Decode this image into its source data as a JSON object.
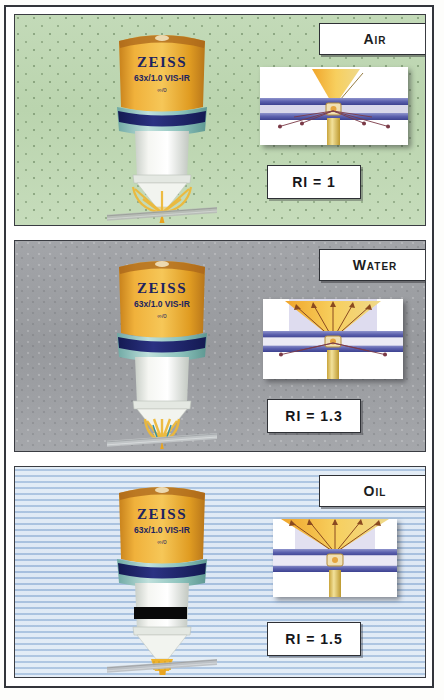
{
  "figure": {
    "panels": [
      {
        "id": "air",
        "media_label": "Air",
        "ri_label": "RI = 1",
        "ri_value": 1.0,
        "background_color": "#bcd6b1",
        "objective": {
          "brand": "ZEISS",
          "spec": "63x/1.0 VIS-IR",
          "tube": "∞/0",
          "collar_color": "#e8a428",
          "ring_color": "#2a2f7a",
          "has_black_band": false
        },
        "inset": {
          "cone_half_angle_deg": 22,
          "cone_color": "#f5c341",
          "rays_scattered": true,
          "coverslip_color": "#6b70b8",
          "note": "narrow collection cone, strong refraction at interfaces"
        }
      },
      {
        "id": "water",
        "media_label": "Water",
        "ri_label": "RI = 1.3",
        "ri_value": 1.3,
        "background_color": "#9d9fa3",
        "objective": {
          "brand": "ZEISS",
          "spec": "63x/1.0 VIS-IR",
          "tube": "∞/0",
          "collar_color": "#e8a428",
          "ring_color": "#2a2f7a",
          "has_black_band": false
        },
        "inset": {
          "cone_half_angle_deg": 42,
          "cone_color": "#f5c341",
          "rays_scattered": true,
          "coverslip_color": "#6b70b8",
          "note": "wider collection cone, reduced refraction"
        }
      },
      {
        "id": "oil",
        "media_label": "Oil",
        "ri_label": "RI = 1.5",
        "ri_value": 1.5,
        "background_color": "#b9cfe8",
        "objective": {
          "brand": "ZEISS",
          "spec": "63x/1.0 VIS-IR",
          "tube": "∞/0",
          "collar_color": "#e8a428",
          "ring_color": "#2a2f7a",
          "has_black_band": true
        },
        "inset": {
          "cone_half_angle_deg": 62,
          "cone_color": "#f5c341",
          "rays_scattered": false,
          "coverslip_color": "#6b70b8",
          "note": "widest collection cone, index matched, no refraction"
        }
      }
    ]
  }
}
